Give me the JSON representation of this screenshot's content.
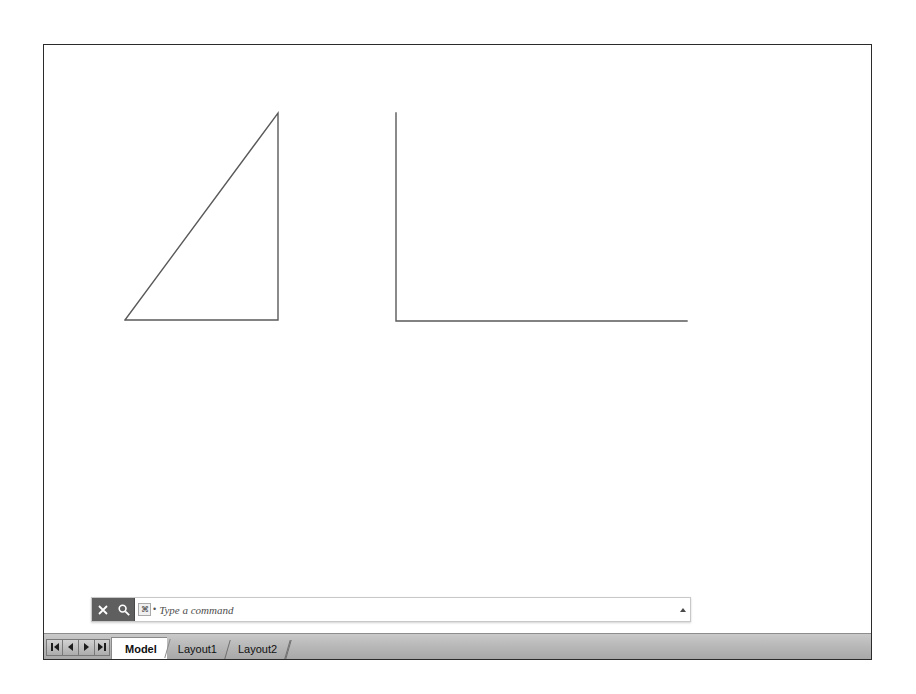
{
  "window": {
    "background_color": "#ffffff",
    "border_color": "#2b2b2b"
  },
  "canvas": {
    "background_color": "#ffffff",
    "stroke_color": "#5a5a5a",
    "shapes": [
      {
        "name": "right-triangle",
        "type": "polyline",
        "points": "124,319 277,112 277,319 124,319"
      },
      {
        "name": "l-shape-polyline",
        "type": "polyline",
        "points": "395,112 395,320 686,320"
      }
    ]
  },
  "command_line": {
    "close_icon": "close-icon",
    "search_icon": "search-icon",
    "prompt_icon_glyph": "⌘",
    "bullet": "•",
    "placeholder": "Type a command",
    "value": "",
    "expand_icon": "expand-up-icon"
  },
  "layout_bar": {
    "nav_buttons": [
      {
        "name": "first-layout-button",
        "icon": "nav-first-icon"
      },
      {
        "name": "previous-layout-button",
        "icon": "nav-previous-icon"
      },
      {
        "name": "next-layout-button",
        "icon": "nav-next-icon"
      },
      {
        "name": "last-layout-button",
        "icon": "nav-last-icon"
      }
    ],
    "tabs": [
      {
        "label": "Model",
        "active": true
      },
      {
        "label": "Layout1",
        "active": false
      },
      {
        "label": "Layout2",
        "active": false
      }
    ]
  }
}
